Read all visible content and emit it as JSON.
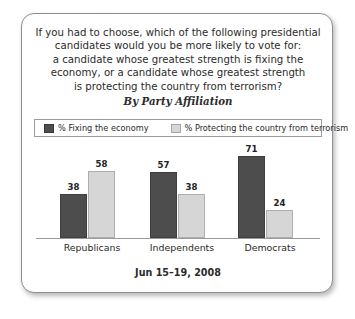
{
  "chart_data": {
    "type": "bar",
    "title_lines": [
      "If you had to choose, which of the following presidential",
      "candidates would you be more likely to vote for:",
      "a candidate whose greatest strength is fixing the",
      "economy, or a candidate whose greatest strength",
      "is protecting the country from terrorism?"
    ],
    "subtitle": "By Party Affiliation",
    "categories": [
      "Republicans",
      "Independents",
      "Democrats"
    ],
    "series": [
      {
        "name": "% Fixing the economy",
        "values": [
          38,
          57,
          71
        ],
        "color": "#4d4d4d"
      },
      {
        "name": "% Protecting the country from terrorism",
        "values": [
          58,
          38,
          24
        ],
        "color": "#d6d6d6"
      }
    ],
    "xlabel": "",
    "ylabel": "",
    "ylim": [
      0,
      80
    ],
    "grid": false,
    "legend_position": "top",
    "data_labels": true,
    "footer": "Jun 15–19, 2008"
  }
}
